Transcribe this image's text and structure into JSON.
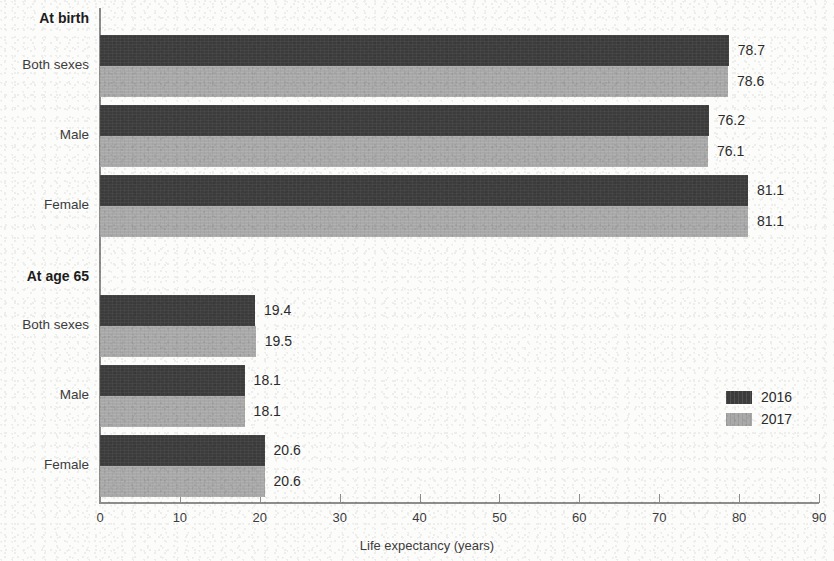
{
  "chart_data": {
    "type": "bar",
    "orientation": "horizontal",
    "title": "",
    "xlabel": "Life expectancy (years)",
    "ylabel": "",
    "xlim": [
      0,
      90
    ],
    "xticks": [
      0,
      10,
      20,
      30,
      40,
      50,
      60,
      70,
      80,
      90
    ],
    "xtick_labels": [
      "0",
      "10",
      "20",
      "30",
      "40",
      "50",
      "60",
      "70",
      "80",
      "90"
    ],
    "grid": false,
    "legend_position": "right",
    "series": [
      {
        "name": "2016",
        "color": "#3c3c3c",
        "values": [
          78.7,
          76.2,
          81.1,
          19.4,
          18.1,
          20.6
        ]
      },
      {
        "name": "2017",
        "color": "#a9a9a9",
        "values": [
          78.6,
          76.1,
          81.1,
          19.5,
          18.1,
          20.6
        ]
      }
    ],
    "categories": [
      "Both sexes",
      "Male",
      "Female",
      "Both sexes",
      "Male",
      "Female"
    ],
    "sections": [
      {
        "label": "At birth",
        "groups": [
          {
            "category": "Both sexes",
            "2016": 78.7,
            "2017": 78.6
          },
          {
            "category": "Male",
            "2016": 76.2,
            "2017": 76.1
          },
          {
            "category": "Female",
            "2016": 81.1,
            "2017": 81.1
          }
        ]
      },
      {
        "label": "At age 65",
        "groups": [
          {
            "category": "Both sexes",
            "2016": 19.4,
            "2017": 19.5
          },
          {
            "category": "Male",
            "2016": 18.1,
            "2017": 18.1
          },
          {
            "category": "Female",
            "2016": 20.6,
            "2017": 20.6
          }
        ]
      }
    ]
  },
  "legend": {
    "items": [
      {
        "label": "2016",
        "color": "#3c3c3c"
      },
      {
        "label": "2017",
        "color": "#a9a9a9"
      }
    ]
  },
  "axis": {
    "x_title": "Life expectancy (years)"
  }
}
